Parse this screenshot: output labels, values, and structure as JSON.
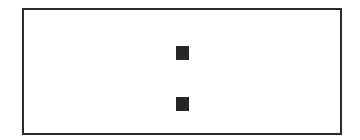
{
  "diagram": {
    "frame": {
      "shape": "rectangle",
      "border_color": "#2a2a2a",
      "fill": "#ffffff"
    },
    "marks": [
      {
        "shape": "square",
        "color": "#262626",
        "position": "top-center"
      },
      {
        "shape": "square",
        "color": "#262626",
        "position": "bottom-center"
      }
    ]
  }
}
